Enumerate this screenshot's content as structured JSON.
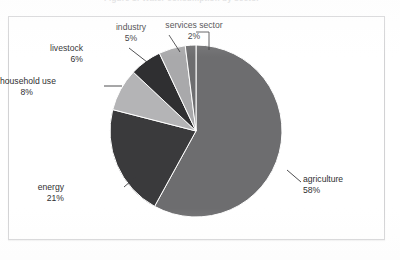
{
  "figure": {
    "caption_remnant": "Figure 1: Water consumption by sector",
    "frame_color": "#d2d2d4",
    "background": "#ffffff"
  },
  "chart_data": {
    "type": "pie",
    "title": "",
    "subtitle": "",
    "xlabel": "",
    "ylabel": "",
    "legend_position": "none",
    "grid": false,
    "labels_show_percent": true,
    "start_angle_deg": 0,
    "direction": "clockwise",
    "center": {
      "x": 196,
      "y": 131
    },
    "radius": 86,
    "categories": [
      "agriculture",
      "energy",
      "household use",
      "livestock",
      "industry",
      "services sector"
    ],
    "values": [
      58,
      21,
      8,
      6,
      5,
      2
    ],
    "unit": "%",
    "slices": [
      {
        "name": "agriculture",
        "value": 58,
        "percent_label": "58%",
        "color": "#6d6d6f",
        "label_position": "right",
        "label_x": 303,
        "label_y": 174,
        "leader": {
          "x1": 287,
          "y1": 170,
          "x2": 301,
          "y2": 182
        }
      },
      {
        "name": "energy",
        "value": 21,
        "percent_label": "21%",
        "color": "#3a3a3c",
        "label_position": "left",
        "label_x": 64,
        "label_y": 182,
        "leader": {
          "x1": 138,
          "y1": 175,
          "x2": 124,
          "y2": 187
        }
      },
      {
        "name": "household use",
        "value": 8,
        "percent_label": "8%",
        "color": "#b4b4b6",
        "label_position": "left",
        "label_x": 33,
        "label_y": 76,
        "leader": {
          "x1": 122,
          "y1": 86,
          "x2": 104,
          "y2": 86
        }
      },
      {
        "name": "livestock",
        "value": 6,
        "percent_label": "6%",
        "color": "#2f2f31",
        "label_position": "left",
        "label_x": 83,
        "label_y": 43,
        "leader": {
          "x1": 147,
          "y1": 62,
          "x2": 129,
          "y2": 48
        }
      },
      {
        "name": "industry",
        "value": 5,
        "percent_label": "5%",
        "color": "#a9a9ab",
        "label_position": "center",
        "label_x": 131,
        "label_y": 22,
        "leader": {
          "x1": 180,
          "y1": 52,
          "x2": 169,
          "y2": 35
        }
      },
      {
        "name": "services sector",
        "value": 2,
        "percent_label": "2%",
        "color": "#6d6d6f",
        "label_position": "center",
        "label_x": 194,
        "label_y": 20,
        "leader_corner": {
          "x1": 209,
          "y1": 50,
          "x2": 209,
          "y2": 32,
          "x3": 196,
          "y3": 32
        }
      }
    ]
  }
}
